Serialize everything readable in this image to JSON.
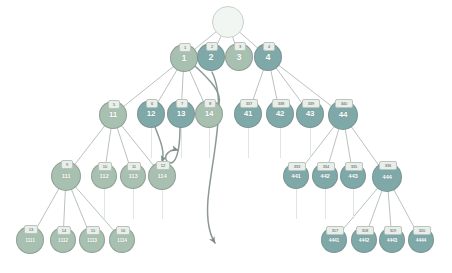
{
  "diagram": {
    "background": "#ffffff",
    "colors": {
      "node_light": "#a8c0b0",
      "node_dark": "#7fa8a8",
      "node_root": "#f2f6f2",
      "badge_fill": "#e9eeea",
      "badge_text": "#4a5550",
      "edge": "#9aa8a0",
      "arrow": "#8b9a94",
      "stub": "#dfe6e0",
      "node_text": "#ffffff"
    },
    "levels": [
      {
        "name": "root",
        "nodes": [
          {
            "id": "root",
            "label": "",
            "badge": "",
            "shade": "root",
            "x": 228,
            "y": 22,
            "r": 16,
            "font": 9,
            "badge_font": 0
          }
        ]
      },
      {
        "name": "level-1",
        "nodes": [
          {
            "id": "n1",
            "label": "1",
            "badge": "1",
            "shade": "light",
            "x": 184,
            "y": 58,
            "r": 14,
            "font": 9,
            "badge_font": 4
          },
          {
            "id": "n2",
            "label": "2",
            "badge": "2",
            "shade": "dark",
            "x": 211,
            "y": 57,
            "r": 14,
            "font": 9,
            "badge_font": 4
          },
          {
            "id": "n3",
            "label": "3",
            "badge": "3",
            "shade": "light",
            "x": 239,
            "y": 57,
            "r": 14,
            "font": 9,
            "badge_font": 4
          },
          {
            "id": "n4",
            "label": "4",
            "badge": "4",
            "shade": "dark",
            "x": 268,
            "y": 57,
            "r": 14,
            "font": 9,
            "badge_font": 4
          }
        ]
      },
      {
        "name": "level-2",
        "nodes": [
          {
            "id": "n11",
            "label": "11",
            "badge": "5",
            "shade": "light",
            "x": 113,
            "y": 115,
            "r": 14,
            "font": 8,
            "badge_font": 4
          },
          {
            "id": "n12",
            "label": "12",
            "badge": "6",
            "shade": "dark",
            "x": 151,
            "y": 114,
            "r": 14,
            "font": 8,
            "badge_font": 4
          },
          {
            "id": "n13",
            "label": "13",
            "badge": "7",
            "shade": "dark",
            "x": 181,
            "y": 114,
            "r": 14,
            "font": 8,
            "badge_font": 4
          },
          {
            "id": "n14",
            "label": "14",
            "badge": "8",
            "shade": "light",
            "x": 209,
            "y": 114,
            "r": 14,
            "font": 8,
            "badge_font": 4
          },
          {
            "id": "n41",
            "label": "41",
            "badge": "337",
            "shade": "dark",
            "x": 248,
            "y": 114,
            "r": 14,
            "font": 8,
            "badge_font": 4
          },
          {
            "id": "n42",
            "label": "42",
            "badge": "338",
            "shade": "dark",
            "x": 280,
            "y": 114,
            "r": 14,
            "font": 8,
            "badge_font": 4
          },
          {
            "id": "n43",
            "label": "43",
            "badge": "339",
            "shade": "dark",
            "x": 310,
            "y": 114,
            "r": 14,
            "font": 8,
            "badge_font": 4
          },
          {
            "id": "n44",
            "label": "44",
            "badge": "340",
            "shade": "dark",
            "x": 343,
            "y": 115,
            "r": 15,
            "font": 8,
            "badge_font": 4
          }
        ]
      },
      {
        "name": "level-3",
        "nodes": [
          {
            "id": "n111",
            "label": "111",
            "badge": "9",
            "shade": "light",
            "x": 66,
            "y": 176,
            "r": 15,
            "font": 6,
            "badge_font": 4
          },
          {
            "id": "n112",
            "label": "112",
            "badge": "10",
            "shade": "light",
            "x": 104,
            "y": 176,
            "r": 13,
            "font": 6,
            "badge_font": 4
          },
          {
            "id": "n113",
            "label": "113",
            "badge": "11",
            "shade": "light",
            "x": 133,
            "y": 176,
            "r": 13,
            "font": 6,
            "badge_font": 4
          },
          {
            "id": "n114",
            "label": "114",
            "badge": "12",
            "shade": "light",
            "x": 162,
            "y": 176,
            "r": 14,
            "font": 6,
            "badge_font": 4
          },
          {
            "id": "n441",
            "label": "441",
            "badge": "333",
            "shade": "dark",
            "x": 296,
            "y": 176,
            "r": 13,
            "font": 6,
            "badge_font": 4
          },
          {
            "id": "n442",
            "label": "442",
            "badge": "334",
            "shade": "dark",
            "x": 325,
            "y": 176,
            "r": 13,
            "font": 6,
            "badge_font": 4
          },
          {
            "id": "n443",
            "label": "443",
            "badge": "335",
            "shade": "dark",
            "x": 353,
            "y": 176,
            "r": 13,
            "font": 6,
            "badge_font": 4
          },
          {
            "id": "n444",
            "label": "444",
            "badge": "336",
            "shade": "dark",
            "x": 387,
            "y": 177,
            "r": 15,
            "font": 6,
            "badge_font": 4
          }
        ]
      },
      {
        "name": "level-4",
        "nodes": [
          {
            "id": "n1111",
            "label": "1111",
            "badge": "13",
            "shade": "light",
            "x": 30,
            "y": 240,
            "r": 14,
            "font": 5,
            "badge_font": 4
          },
          {
            "id": "n1112",
            "label": "1112",
            "badge": "14",
            "shade": "light",
            "x": 63,
            "y": 240,
            "r": 13,
            "font": 5,
            "badge_font": 4
          },
          {
            "id": "n1113",
            "label": "1113",
            "badge": "15",
            "shade": "light",
            "x": 92,
            "y": 240,
            "r": 13,
            "font": 5,
            "badge_font": 4
          },
          {
            "id": "n1114",
            "label": "1114",
            "badge": "16",
            "shade": "light",
            "x": 122,
            "y": 240,
            "r": 13,
            "font": 5,
            "badge_font": 4
          },
          {
            "id": "n4441",
            "label": "4441",
            "badge": "317",
            "shade": "dark",
            "x": 334,
            "y": 240,
            "r": 13,
            "font": 5,
            "badge_font": 4
          },
          {
            "id": "n4442",
            "label": "4442",
            "badge": "318",
            "shade": "dark",
            "x": 364,
            "y": 240,
            "r": 13,
            "font": 5,
            "badge_font": 4
          },
          {
            "id": "n4443",
            "label": "4443",
            "badge": "319",
            "shade": "dark",
            "x": 392,
            "y": 240,
            "r": 13,
            "font": 5,
            "badge_font": 4
          },
          {
            "id": "n4444",
            "label": "4444",
            "badge": "320",
            "shade": "dark",
            "x": 421,
            "y": 240,
            "r": 13,
            "font": 5,
            "badge_font": 4
          }
        ]
      }
    ],
    "tree_edges": [
      {
        "from": "root",
        "to": "n1"
      },
      {
        "from": "root",
        "to": "n2"
      },
      {
        "from": "root",
        "to": "n3"
      },
      {
        "from": "root",
        "to": "n4"
      },
      {
        "from": "n1",
        "to": "n11"
      },
      {
        "from": "n1",
        "to": "n12"
      },
      {
        "from": "n1",
        "to": "n13"
      },
      {
        "from": "n1",
        "to": "n14"
      },
      {
        "from": "n4",
        "to": "n41"
      },
      {
        "from": "n4",
        "to": "n42"
      },
      {
        "from": "n4",
        "to": "n43"
      },
      {
        "from": "n4",
        "to": "n44"
      },
      {
        "from": "n11",
        "to": "n111"
      },
      {
        "from": "n11",
        "to": "n112"
      },
      {
        "from": "n11",
        "to": "n113"
      },
      {
        "from": "n11",
        "to": "n114"
      },
      {
        "from": "n44",
        "to": "n441"
      },
      {
        "from": "n44",
        "to": "n442"
      },
      {
        "from": "n44",
        "to": "n443"
      },
      {
        "from": "n44",
        "to": "n444"
      },
      {
        "from": "n111",
        "to": "n1111"
      },
      {
        "from": "n111",
        "to": "n1112"
      },
      {
        "from": "n111",
        "to": "n1113"
      },
      {
        "from": "n111",
        "to": "n1114"
      },
      {
        "from": "n444",
        "to": "n4441"
      },
      {
        "from": "n444",
        "to": "n4442"
      },
      {
        "from": "n444",
        "to": "n4443"
      },
      {
        "from": "n444",
        "to": "n4444"
      }
    ],
    "stubs": [
      {
        "name": "stub-under-n12",
        "x": 151,
        "y": 128,
        "h": 30
      },
      {
        "name": "stub-under-n13",
        "x": 181,
        "y": 128,
        "h": 30
      },
      {
        "name": "stub-under-n14",
        "x": 209,
        "y": 128,
        "h": 30
      },
      {
        "name": "stub-under-n41",
        "x": 248,
        "y": 128,
        "h": 30
      },
      {
        "name": "stub-under-n42",
        "x": 280,
        "y": 128,
        "h": 30
      },
      {
        "name": "stub-under-n43",
        "x": 310,
        "y": 128,
        "h": 30
      },
      {
        "name": "stub-under-n112",
        "x": 104,
        "y": 189,
        "h": 30
      },
      {
        "name": "stub-under-n113",
        "x": 133,
        "y": 189,
        "h": 30
      },
      {
        "name": "stub-under-n114",
        "x": 162,
        "y": 189,
        "h": 30
      },
      {
        "name": "stub-under-n441",
        "x": 296,
        "y": 189,
        "h": 30
      },
      {
        "name": "stub-under-n442",
        "x": 325,
        "y": 189,
        "h": 30
      },
      {
        "name": "stub-under-n443",
        "x": 353,
        "y": 189,
        "h": 30
      }
    ],
    "curved_arrows": [
      {
        "name": "arrow-n12-to-n114",
        "path": "M 155 127 C 161 142 165 152 162 162",
        "note": "from node 12 down to node 114"
      },
      {
        "name": "arrow-n13-loop",
        "path": "M 180 128 C 180 150 176 167 168 162 C 161 157 170 148 178 150",
        "note": "loop from node 13 back up"
      },
      {
        "name": "arrow-n2-long-descent",
        "path": "M 212 72 C 226 100 214 150 209 190 C 205 220 210 235 215 243",
        "note": "long curve from node 2 descending past node 41 to lower area"
      },
      {
        "name": "arrow-n1-to-n14-hook",
        "path": "M 195 66 C 210 80 222 92 219 104 C 217 112 210 110 211 104",
        "note": "short hook ending near node 14"
      }
    ]
  }
}
